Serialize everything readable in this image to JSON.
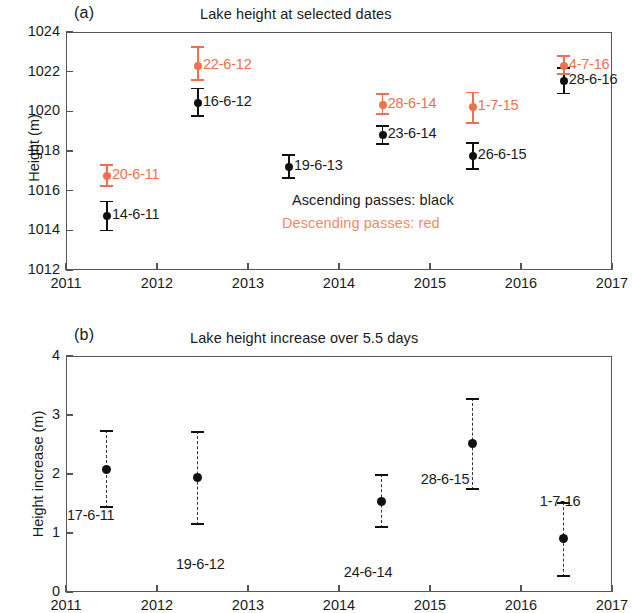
{
  "figure": {
    "panels": [
      {
        "letter": "(a)",
        "title": "Lake height at selected dates",
        "ylabel": "Height (m)"
      },
      {
        "letter": "(b)",
        "title": "Lake height increase over 5.5 days",
        "ylabel": "Height increase (m)"
      }
    ],
    "legend": {
      "ascending": "Ascending passes: black",
      "descending": "Descending passes: red"
    },
    "colors": {
      "black": "#111111",
      "red": "#ef6f4e",
      "legend_red": "#f08a6e",
      "axis": "#555555"
    }
  },
  "chart_data": [
    {
      "type": "scatter",
      "panel": "(a)",
      "title": "Lake height at selected dates",
      "xlabel": "",
      "ylabel": "Height (m)",
      "xlim": [
        2011,
        2017
      ],
      "ylim": [
        1012,
        1024
      ],
      "xticks": [
        "2011",
        "2012",
        "2013",
        "2014",
        "2015",
        "2016",
        "2017"
      ],
      "yticks": [
        "1012",
        "1014",
        "1016",
        "1018",
        "1020",
        "1022",
        "1024"
      ],
      "grid": false,
      "legend": [
        "Ascending passes: black",
        "Descending passes: red"
      ],
      "series": [
        {
          "name": "Ascending passes",
          "color": "#111111",
          "points": [
            {
              "label": "14-6-11",
              "x": 2011.45,
              "y": 1014.7,
              "yerr_low": 1013.95,
              "yerr_high": 1015.5
            },
            {
              "label": "16-6-12",
              "x": 2012.45,
              "y": 1020.4,
              "yerr_low": 1019.7,
              "yerr_high": 1021.2
            },
            {
              "label": "19-6-13",
              "x": 2013.45,
              "y": 1017.2,
              "yerr_low": 1016.6,
              "yerr_high": 1017.85
            },
            {
              "label": "23-6-14",
              "x": 2014.48,
              "y": 1018.8,
              "yerr_low": 1018.3,
              "yerr_high": 1019.3
            },
            {
              "label": "26-6-15",
              "x": 2015.47,
              "y": 1017.75,
              "yerr_low": 1017.05,
              "yerr_high": 1018.45
            },
            {
              "label": "28-6-16",
              "x": 2016.47,
              "y": 1021.55,
              "yerr_low": 1020.85,
              "yerr_high": 1022.25
            }
          ]
        },
        {
          "name": "Descending passes",
          "color": "#ef6f4e",
          "points": [
            {
              "label": "20-6-11",
              "x": 2011.45,
              "y": 1016.75,
              "yerr_low": 1016.2,
              "yerr_high": 1017.35
            },
            {
              "label": "22-6-12",
              "x": 2012.45,
              "y": 1022.3,
              "yerr_low": 1021.55,
              "yerr_high": 1023.3
            },
            {
              "label": "28-6-14",
              "x": 2014.48,
              "y": 1020.3,
              "yerr_low": 1019.8,
              "yerr_high": 1020.9
            },
            {
              "label": "1-7-15",
              "x": 2015.47,
              "y": 1020.2,
              "yerr_low": 1019.35,
              "yerr_high": 1021.0
            },
            {
              "label": "4-7-16",
              "x": 2016.47,
              "y": 1022.3,
              "yerr_low": 1021.85,
              "yerr_high": 1022.85
            }
          ]
        }
      ]
    },
    {
      "type": "scatter",
      "panel": "(b)",
      "title": "Lake height increase over 5.5 days",
      "xlabel": "",
      "ylabel": "Height increase (m)",
      "xlim": [
        2011,
        2017
      ],
      "ylim": [
        0,
        4
      ],
      "xticks": [
        "2011",
        "2012",
        "2013",
        "2014",
        "2015",
        "2016",
        "2017"
      ],
      "yticks": [
        "0",
        "1",
        "2",
        "3",
        "4"
      ],
      "grid": false,
      "series": [
        {
          "name": "Height increase",
          "color": "#111111",
          "points": [
            {
              "label": "17-6-11",
              "x": 2011.45,
              "y": 2.08,
              "yerr_low": 1.42,
              "yerr_high": 2.75
            },
            {
              "label": "19-6-12",
              "x": 2012.45,
              "y": 1.94,
              "yerr_low": 1.14,
              "yerr_high": 2.73
            },
            {
              "label": "24-6-14",
              "x": 2014.47,
              "y": 1.53,
              "yerr_low": 1.08,
              "yerr_high": 2.0
            },
            {
              "label": "28-6-15",
              "x": 2015.47,
              "y": 2.52,
              "yerr_low": 1.73,
              "yerr_high": 3.28
            },
            {
              "label": "1-7-16",
              "x": 2016.47,
              "y": 0.9,
              "yerr_low": 0.25,
              "yerr_high": 1.53
            }
          ]
        }
      ]
    }
  ]
}
